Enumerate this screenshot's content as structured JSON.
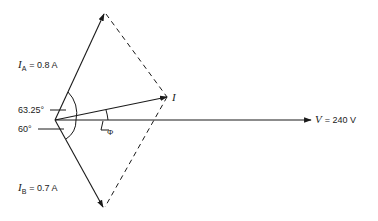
{
  "diagram": {
    "phasors": {
      "ia": {
        "symbol": "I",
        "sub": "A",
        "value_text": "= 0.8 A",
        "magnitude": 0.8,
        "unit": "A",
        "angle_deg": 63.25
      },
      "ib": {
        "symbol": "I",
        "sub": "B",
        "value_text": "= 0.7 A",
        "magnitude": 0.7,
        "unit": "A",
        "angle_deg": -60
      },
      "i": {
        "symbol": "I"
      },
      "v": {
        "symbol": "V",
        "value_text": "= 240 V",
        "magnitude": 240,
        "unit": "V",
        "angle_deg": 0
      }
    },
    "angles": {
      "a": "63.25°",
      "b": "60°",
      "phi": "Φ"
    },
    "colors": {
      "line": "#1a1a1a",
      "background": "#ffffff"
    }
  }
}
